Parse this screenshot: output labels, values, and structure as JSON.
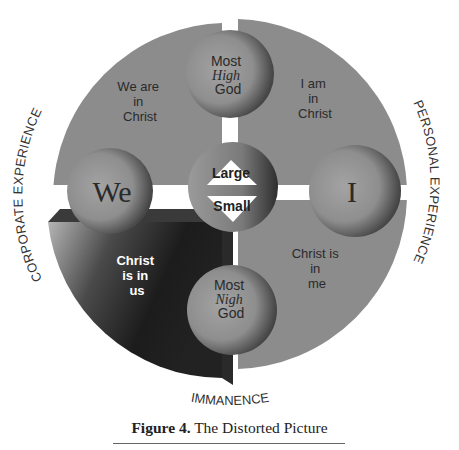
{
  "figure": {
    "top_label_fragment": "",
    "quadrants": {
      "top_left": [
        "We are",
        "in",
        "Christ"
      ],
      "top_right": [
        "I am",
        "in",
        "Christ"
      ],
      "bottom_left": [
        "Christ",
        "is in",
        "us"
      ],
      "bottom_right": [
        "Christ is",
        "in",
        "me"
      ]
    },
    "circles": {
      "top": {
        "line1": "Most",
        "line2": "High",
        "line3": "God"
      },
      "bottom": {
        "line1": "Most",
        "line2": "Nigh",
        "line3": "God"
      },
      "left": {
        "label": "We"
      },
      "right": {
        "label": "I"
      },
      "center": {
        "upper": "Large",
        "lower": "Small"
      }
    },
    "axis_labels": {
      "left": "CORPORATE EXPERIENCE",
      "right": "PERSONAL EXPERIENCE",
      "bottom": "IMMANENCE"
    },
    "caption": {
      "number": "Figure 4.",
      "title": "The Distorted Picture"
    },
    "colors": {
      "quadrant_gray": "#8c8c8c",
      "dark_quadrant": "#1e1e1e",
      "circle_light": "#9a9a9a",
      "circle_dark": "#3a3a3a",
      "text_dark": "#2a2a2a",
      "text_light": "#ffffff"
    }
  }
}
